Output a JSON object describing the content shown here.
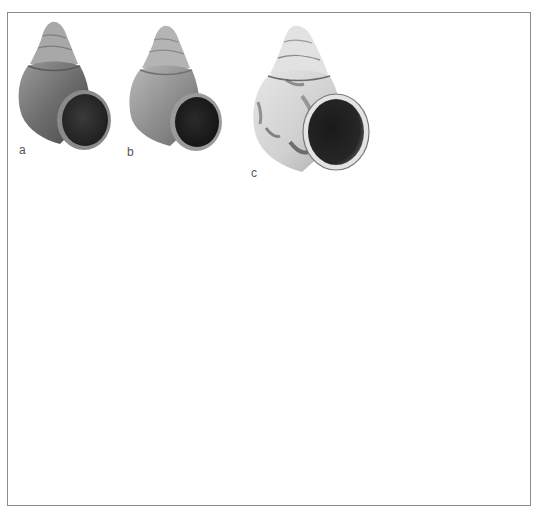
{
  "plate": {
    "frame_color": "#8a8a8a",
    "background": "#ffffff"
  },
  "specimens": [
    {
      "label": "a",
      "description": "snail-shell",
      "tone": "dark-gray"
    },
    {
      "label": "b",
      "description": "snail-shell",
      "tone": "mid-gray"
    },
    {
      "label": "c",
      "description": "snail-shell",
      "tone": "light-mottled"
    }
  ]
}
